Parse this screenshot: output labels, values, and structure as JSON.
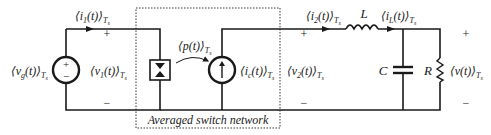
{
  "diagram": {
    "box_caption": "Averaged switch network",
    "labels": {
      "vg": "⟨v",
      "vg_sub": "g",
      "vg_rest": "(t)⟩",
      "i1": "⟨i",
      "i1_sub": "1",
      "i1_rest": "(t)⟩",
      "v1": "⟨v",
      "v1_sub": "1",
      "v1_rest": "(t)⟩",
      "p": "⟨p(t)⟩",
      "ic": "⟨i",
      "ic_sub": "c",
      "ic_rest": "(t)⟩",
      "i2": "⟨i",
      "i2_sub": "2",
      "i2_rest": "(t)⟩",
      "v2": "⟨v",
      "v2_sub": "2",
      "v2_rest": "(t)⟩",
      "L": "L",
      "iL": "⟨i",
      "iL_sub": "L",
      "iL_rest": "(t)⟩",
      "C": "C",
      "R": "R",
      "v": "⟨v(t)⟩",
      "Ts": "T",
      "Ts_sub": "s"
    },
    "signs": {
      "plus": "+",
      "minus": "−"
    },
    "components": [
      {
        "name": "voltage-source",
        "label": "vg"
      },
      {
        "name": "power-sink",
        "label": "switch"
      },
      {
        "name": "power-source",
        "label": "ic"
      },
      {
        "name": "inductor",
        "label": "L"
      },
      {
        "name": "capacitor",
        "label": "C"
      },
      {
        "name": "resistor",
        "label": "R"
      }
    ]
  }
}
